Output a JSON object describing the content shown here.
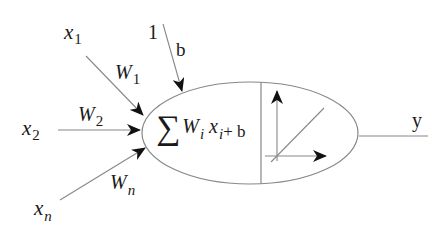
{
  "diagram": {
    "type": "neuron-model",
    "inputs": [
      {
        "symbol": "x",
        "index": "1",
        "weight_symbol": "W",
        "weight_index": "1"
      },
      {
        "symbol": "x",
        "index": "2",
        "weight_symbol": "W",
        "weight_index": "2"
      },
      {
        "symbol": "x",
        "index": "n",
        "weight_symbol": "W",
        "weight_index": "n"
      }
    ],
    "bias": {
      "input": "1",
      "label": "b"
    },
    "summation": {
      "sigma": "∑",
      "w": "W",
      "w_index": "i",
      "x": "x",
      "x_index": "i",
      "plus_bias": "+ b"
    },
    "output": {
      "label": "y"
    },
    "colors": {
      "stroke": "#777777",
      "arrowhead": "#111111",
      "text": "#1a1a1a"
    }
  }
}
